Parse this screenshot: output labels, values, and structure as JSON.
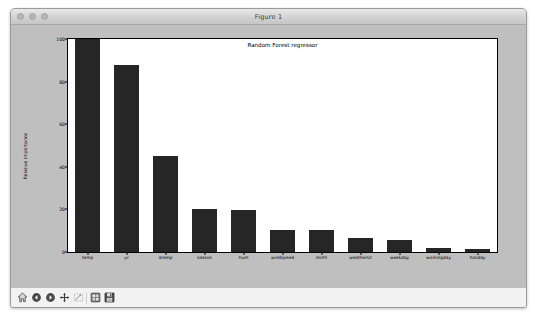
{
  "window": {
    "title": "Figure 1",
    "traffic_lights": [
      "close",
      "minimize",
      "zoom"
    ]
  },
  "toolbar": {
    "buttons": [
      {
        "name": "home-icon",
        "tooltip": "Reset original view"
      },
      {
        "name": "back-arrow-icon",
        "tooltip": "Back to previous view"
      },
      {
        "name": "forward-arrow-icon",
        "tooltip": "Forward to next view"
      },
      {
        "name": "pan-move-icon",
        "tooltip": "Pan axes with left mouse, zoom with right"
      },
      {
        "name": "zoom-rectangle-icon",
        "tooltip": "Zoom to rectangle"
      },
      {
        "name": "configure-subplots-icon",
        "tooltip": "Configure subplots"
      },
      {
        "name": "save-figure-icon",
        "tooltip": "Save the figure"
      }
    ]
  },
  "colors": {
    "bar": "#262626",
    "figure_background": "#bfbfbf",
    "axes_background": "#ffffff",
    "window_chrome": "#d9d9d9"
  },
  "chart_data": {
    "type": "bar",
    "title": "Random Forest regressor",
    "xlabel": "",
    "ylabel": "Relative Importance",
    "categories": [
      "temp",
      "yr",
      "atemp",
      "season",
      "hum",
      "windspeed",
      "mnth",
      "weathersit",
      "weekday",
      "workingday",
      "holiday"
    ],
    "values": [
      100,
      88,
      45,
      20,
      19.5,
      10.5,
      10.5,
      6.5,
      5.5,
      1.8,
      1.3
    ],
    "ylim": [
      0,
      100
    ],
    "ytick_labels": [
      "0",
      "20",
      "40",
      "60",
      "80",
      "100"
    ],
    "ytick_values": [
      0,
      20,
      40,
      60,
      80,
      100
    ],
    "grid": false,
    "legend": null
  }
}
